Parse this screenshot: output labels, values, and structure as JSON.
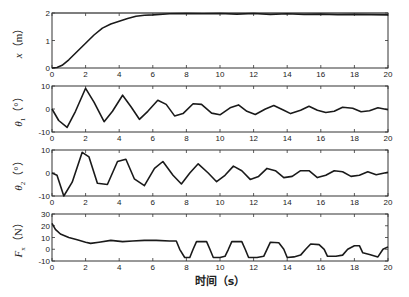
{
  "chart_data": [
    {
      "type": "line",
      "ylabel": "x (m)",
      "ylabel_var": "x",
      "ylabel_sub": "",
      "ylabel_unit": "（m）",
      "ylim": [
        0,
        2
      ],
      "yticks": [
        0,
        1,
        2
      ],
      "reference_line": 2,
      "x": [
        0,
        0.3,
        0.6,
        1,
        1.5,
        2,
        2.5,
        3,
        3.5,
        4,
        4.5,
        5,
        5.5,
        6,
        7,
        8,
        9,
        10,
        11,
        12,
        13,
        14,
        15,
        16,
        17,
        18,
        19,
        20
      ],
      "y": [
        0,
        0.02,
        0.1,
        0.3,
        0.6,
        0.9,
        1.2,
        1.45,
        1.6,
        1.7,
        1.8,
        1.88,
        1.92,
        1.93,
        1.97,
        1.98,
        1.97,
        1.98,
        1.96,
        1.98,
        1.95,
        1.97,
        1.95,
        1.96,
        1.94,
        1.95,
        1.94,
        1.93
      ]
    },
    {
      "type": "line",
      "ylabel": "θ1 (°)",
      "ylabel_var": "θ",
      "ylabel_sub": "1",
      "ylabel_unit": "（°）",
      "ylim": [
        -10,
        10
      ],
      "yticks": [
        -10,
        0,
        10
      ],
      "x": [
        0,
        0.4,
        0.9,
        1.4,
        2,
        2.5,
        3.1,
        3.6,
        4.2,
        4.7,
        5.2,
        5.7,
        6.3,
        6.8,
        7.3,
        7.8,
        8.4,
        8.9,
        9.5,
        10,
        10.6,
        11.1,
        11.6,
        12.1,
        12.7,
        13.2,
        13.8,
        14.2,
        14.8,
        15.3,
        15.8,
        16.3,
        16.8,
        17.3,
        17.9,
        18.4,
        18.9,
        19.4,
        20
      ],
      "y": [
        0,
        -5,
        -8,
        -1,
        9,
        3,
        -5.5,
        -1,
        6,
        1,
        -4.5,
        -1,
        3.8,
        2,
        -3,
        -2,
        2.3,
        2,
        -1.8,
        -2.5,
        0.5,
        1.8,
        -1,
        -2.4,
        0,
        1.5,
        -0.5,
        -2,
        -0.5,
        1.2,
        -0.5,
        -1.5,
        -1,
        0.8,
        0.3,
        -1.2,
        -0.8,
        0.5,
        -0.3
      ]
    },
    {
      "type": "line",
      "ylabel": "θ2 (°)",
      "ylabel_var": "θ",
      "ylabel_sub": "2",
      "ylabel_unit": "（°）",
      "ylim": [
        -10,
        10
      ],
      "yticks": [
        -10,
        0,
        10
      ],
      "x": [
        0,
        0.3,
        0.7,
        1.2,
        1.8,
        2.2,
        2.7,
        3.3,
        3.9,
        4.4,
        4.9,
        5.5,
        6.1,
        6.6,
        7.2,
        7.7,
        8.2,
        8.7,
        9.3,
        9.8,
        10.3,
        10.8,
        11.3,
        11.8,
        12.3,
        12.8,
        13.3,
        13.8,
        14.3,
        14.8,
        15.3,
        15.8,
        16.3,
        16.8,
        17.3,
        17.8,
        18.3,
        18.8,
        19.3,
        20
      ],
      "y": [
        0,
        -1,
        -10,
        -4,
        9,
        7,
        -4.5,
        -5,
        5,
        6,
        -2.5,
        -5.5,
        2,
        5,
        -1,
        -4.8,
        0,
        4,
        0,
        -3.8,
        -1,
        3,
        1,
        -2.8,
        -1.5,
        2,
        1,
        -2,
        -1.5,
        1,
        1,
        -2,
        -1,
        1,
        0.5,
        -1.5,
        -1,
        0.5,
        -0.8,
        0.3
      ]
    },
    {
      "type": "line",
      "ylabel": "Fx (N)",
      "ylabel_var": "F",
      "ylabel_sub": "x",
      "ylabel_unit": "（N）",
      "ylim": [
        -10,
        30
      ],
      "yticks": [
        -10,
        0,
        10,
        20,
        30
      ],
      "x": [
        0,
        0.2,
        0.5,
        1,
        1.5,
        2,
        2.3,
        2.8,
        3.5,
        4.2,
        4.8,
        5.5,
        6.2,
        7,
        7.4,
        7.6,
        7.9,
        8.2,
        8.4,
        8.6,
        9.2,
        9.4,
        9.6,
        10,
        10.3,
        10.5,
        10.7,
        11.3,
        11.5,
        11.7,
        12.2,
        12.6,
        12.8,
        13,
        13.5,
        13.8,
        14,
        14.4,
        14.8,
        15.1,
        15.4,
        15.9,
        16.2,
        16.4,
        16.9,
        17.3,
        17.6,
        18,
        18.3,
        18.5,
        18.9,
        19.4,
        19.7,
        20
      ],
      "y": [
        22,
        17,
        13,
        10,
        8,
        6,
        5,
        6,
        7.5,
        6.5,
        7,
        7.5,
        7.5,
        7,
        7,
        0,
        -7,
        -7,
        0,
        6.5,
        6.5,
        0,
        -7,
        -7,
        -6,
        0,
        6.5,
        6.5,
        0,
        -7,
        -7,
        -6,
        0,
        6,
        5.5,
        0,
        -7,
        -6.5,
        -5,
        0,
        4.5,
        4,
        0,
        -6,
        -6,
        -5,
        0,
        3,
        3,
        -3,
        -4.5,
        -6.5,
        0,
        2
      ]
    }
  ],
  "x_axis": {
    "label": "时间（s）",
    "xlim": [
      0,
      20
    ],
    "xticks": [
      "0",
      "2",
      "4",
      "6",
      "8",
      "10",
      "12",
      "14",
      "16",
      "18",
      "20"
    ]
  }
}
